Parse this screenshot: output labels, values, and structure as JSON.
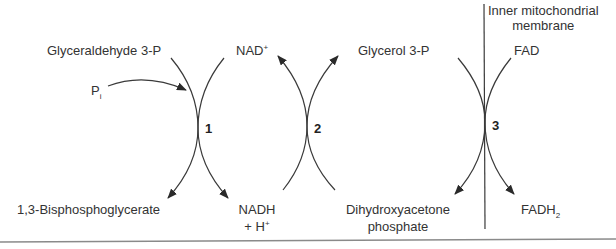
{
  "diagram": {
    "membrane_label_line1": "Inner mitochondrial",
    "membrane_label_line2": "membrane",
    "reaction1": {
      "number": "1",
      "substrate": "Glyceraldehyde 3-P",
      "cosubstrate": "P",
      "cosubstrate_sub": "i",
      "product": "1,3-Bisphosphoglycerate",
      "coenzyme_in": "NAD",
      "coenzyme_in_sup": "+",
      "coenzyme_out_line1": "NADH",
      "coenzyme_out_line2": "+ H",
      "coenzyme_out_sup": "+"
    },
    "reaction2": {
      "number": "2",
      "substrate": "Dihydroxyacetone",
      "substrate_line2": "phosphate",
      "product": "Glycerol 3-P"
    },
    "reaction3": {
      "number": "3",
      "substrate": "Glycerol 3-P",
      "coenzyme_in": "FAD",
      "product_line1": "Dihydroxyacetone",
      "product_line2": "phosphate",
      "coenzyme_out": "FADH",
      "coenzyme_out_sub": "2"
    },
    "colors": {
      "line": "#3a3a3a",
      "text": "#333333",
      "rule": "#8a8a8a"
    }
  }
}
